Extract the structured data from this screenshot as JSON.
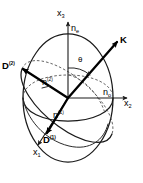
{
  "figure": {
    "background_color": "#ffffff",
    "line_color": "#1a1a1a"
  },
  "axes": [
    {
      "id": "x3",
      "label_base": "x",
      "label_sub": "3",
      "direction": "vertical-up",
      "label_x": 57,
      "label_y": 14
    },
    {
      "id": "x2",
      "label_base": "x",
      "label_sub": "2",
      "direction": "horizontal-right",
      "label_x": 126,
      "label_y": 103
    },
    {
      "id": "x1",
      "label_base": "x",
      "label_sub": "1",
      "direction": "lower-left-front",
      "label_x": 36,
      "label_y": 152
    }
  ],
  "refractive_indices": [
    {
      "id": "ne",
      "label_base": "n",
      "label_sub": "e",
      "description": "extraordinary index along x3",
      "label_x": 72,
      "label_y": 29
    },
    {
      "id": "no",
      "label_base": "n",
      "label_sub": "o",
      "description": "ordinary index along x2",
      "label_x": 104,
      "label_y": 93
    },
    {
      "id": "n2",
      "label_base": "n",
      "label_sup": "(2)",
      "description": "index of eigenwave 2",
      "label_x": 43,
      "label_y": 82
    },
    {
      "id": "n1",
      "label_base": "n",
      "label_sup": "(1)",
      "description": "index of eigenwave 1",
      "label_x": 54,
      "label_y": 115
    }
  ],
  "vectors": [
    {
      "id": "K",
      "label": "K",
      "bold": true,
      "description": "wave normal direction",
      "label_x": 122,
      "label_y": 40
    },
    {
      "id": "D2",
      "label_base": "D",
      "label_sup": "(2)",
      "bold": true,
      "description": "electric displacement eigenvector 2",
      "label_x": 3,
      "label_y": 66
    },
    {
      "id": "D1",
      "label_base": "D",
      "label_sup": "(1)",
      "bold": true,
      "description": "electric displacement eigenvector 1",
      "label_x": 44,
      "label_y": 140
    }
  ],
  "angle": {
    "id": "theta",
    "symbol": "θ",
    "description": "angle between x3 axis and wave normal K",
    "label_x": 80,
    "label_y": 59
  }
}
